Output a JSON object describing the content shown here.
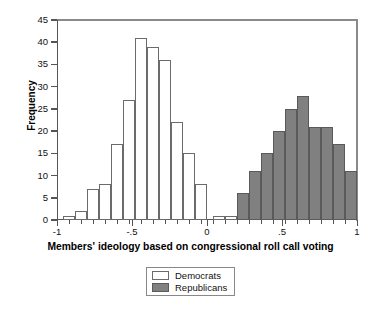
{
  "chart_data": {
    "type": "bar",
    "title": "",
    "xlabel": "Members' ideology based on congressional roll call voting",
    "ylabel": "Frequency",
    "xlim": [
      -1,
      1
    ],
    "ylim": [
      0,
      45
    ],
    "xticks": [
      -1,
      -0.5,
      0,
      0.5,
      1
    ],
    "xtick_labels": [
      "-1",
      "-.5",
      "0",
      ".5",
      "1"
    ],
    "yticks": [
      0,
      5,
      10,
      15,
      20,
      25,
      30,
      35,
      40,
      45
    ],
    "ytick_labels": [
      "0",
      "5",
      "10",
      "15",
      "20",
      "25",
      "30",
      "35",
      "40",
      "45"
    ],
    "grid": false,
    "bin_width": 0.08,
    "legend_position": "below-center",
    "series": [
      {
        "name": "Democrats",
        "color": "#ffffff",
        "edge_color": "#6b6b6b",
        "bins": [
          {
            "x0": -0.96,
            "x1": -0.88,
            "value": 1
          },
          {
            "x0": -0.88,
            "x1": -0.8,
            "value": 2
          },
          {
            "x0": -0.8,
            "x1": -0.72,
            "value": 7
          },
          {
            "x0": -0.72,
            "x1": -0.64,
            "value": 8
          },
          {
            "x0": -0.64,
            "x1": -0.56,
            "value": 17
          },
          {
            "x0": -0.56,
            "x1": -0.48,
            "value": 27
          },
          {
            "x0": -0.48,
            "x1": -0.4,
            "value": 41
          },
          {
            "x0": -0.4,
            "x1": -0.32,
            "value": 39
          },
          {
            "x0": -0.32,
            "x1": -0.24,
            "value": 36
          },
          {
            "x0": -0.24,
            "x1": -0.16,
            "value": 22
          },
          {
            "x0": -0.16,
            "x1": -0.08,
            "value": 15
          },
          {
            "x0": -0.08,
            "x1": 0.0,
            "value": 8
          },
          {
            "x0": 0.04,
            "x1": 0.12,
            "value": 1
          },
          {
            "x0": 0.12,
            "x1": 0.2,
            "value": 1
          }
        ]
      },
      {
        "name": "Republicans",
        "color": "#808080",
        "edge_color": "#5a5a5a",
        "bins": [
          {
            "x0": 0.2,
            "x1": 0.28,
            "value": 6
          },
          {
            "x0": 0.28,
            "x1": 0.36,
            "value": 11
          },
          {
            "x0": 0.36,
            "x1": 0.44,
            "value": 15
          },
          {
            "x0": 0.44,
            "x1": 0.52,
            "value": 20
          },
          {
            "x0": 0.52,
            "x1": 0.6,
            "value": 25
          },
          {
            "x0": 0.6,
            "x1": 0.68,
            "value": 28
          },
          {
            "x0": 0.68,
            "x1": 0.76,
            "value": 21
          },
          {
            "x0": 0.76,
            "x1": 0.84,
            "value": 21
          },
          {
            "x0": 0.84,
            "x1": 0.92,
            "value": 17
          },
          {
            "x0": 0.92,
            "x1": 1.0,
            "value": 11
          },
          {
            "x0": 1.0,
            "x1": 1.08,
            "value": 4
          },
          {
            "x0": 1.08,
            "x1": 1.16,
            "value": 2
          }
        ]
      }
    ]
  },
  "legend": {
    "items": [
      {
        "label": "Democrats",
        "swatch": "democrat-swatch"
      },
      {
        "label": "Republicans",
        "swatch": "republican-swatch"
      }
    ]
  }
}
